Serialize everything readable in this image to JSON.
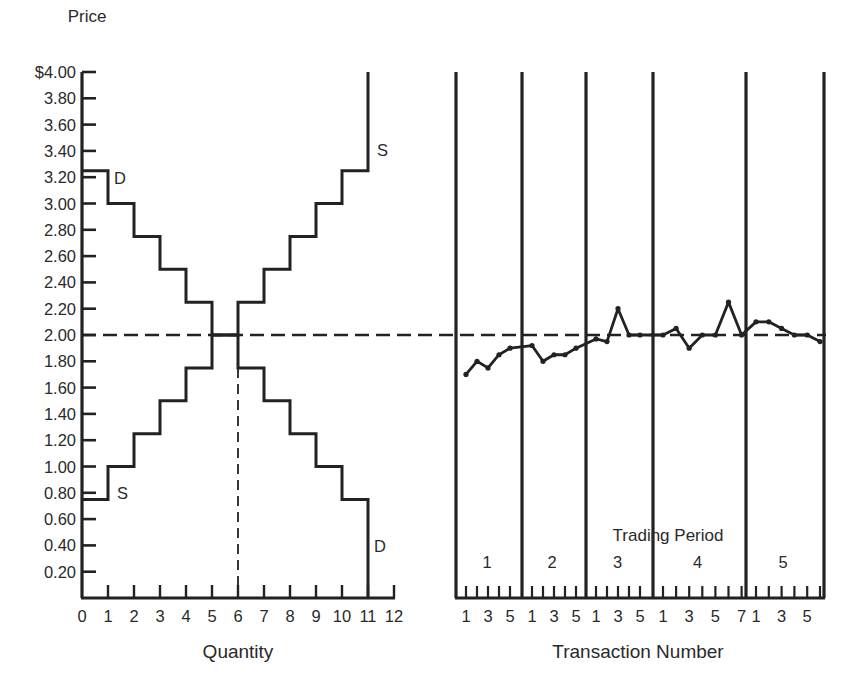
{
  "chart_data": [
    {
      "type": "line",
      "title": "",
      "ylabel": "Price",
      "xlabel": "Quantity",
      "ylim": [
        0,
        4.0
      ],
      "xlim": [
        0,
        12
      ],
      "y_ticks": [
        "$4.00",
        "3.80",
        "3.60",
        "3.40",
        "3.20",
        "3.00",
        "2.80",
        "2.60",
        "2.40",
        "2.20",
        "2.00",
        "1.80",
        "1.60",
        "1.40",
        "1.20",
        "1.00",
        "0.80",
        "0.60",
        "0.40",
        "0.20"
      ],
      "x_ticks": [
        "0",
        "1",
        "2",
        "3",
        "4",
        "5",
        "6",
        "7",
        "8",
        "9",
        "10",
        "11",
        "12"
      ],
      "equilibrium_price": 2.0,
      "equilibrium_quantity": 6,
      "series": [
        {
          "name": "D",
          "kind": "step",
          "description": "Demand step function",
          "steps": [
            {
              "q_from": 0,
              "q_to": 1,
              "price": 3.25
            },
            {
              "q_from": 1,
              "q_to": 2,
              "price": 3.0
            },
            {
              "q_from": 2,
              "q_to": 3,
              "price": 2.75
            },
            {
              "q_from": 3,
              "q_to": 4,
              "price": 2.5
            },
            {
              "q_from": 4,
              "q_to": 5,
              "price": 2.25
            },
            {
              "q_from": 5,
              "q_to": 6,
              "price": 2.0
            },
            {
              "q_from": 6,
              "q_to": 7,
              "price": 1.75
            },
            {
              "q_from": 7,
              "q_to": 8,
              "price": 1.5
            },
            {
              "q_from": 8,
              "q_to": 9,
              "price": 1.25
            },
            {
              "q_from": 9,
              "q_to": 10,
              "price": 1.0
            },
            {
              "q_from": 10,
              "q_to": 11,
              "price": 0.75
            },
            {
              "q_from": 11,
              "q_to": 11,
              "price": 0.0
            }
          ]
        },
        {
          "name": "S",
          "kind": "step",
          "description": "Supply step function",
          "steps": [
            {
              "q_from": 0,
              "q_to": 1,
              "price": 0.75
            },
            {
              "q_from": 1,
              "q_to": 2,
              "price": 1.0
            },
            {
              "q_from": 2,
              "q_to": 3,
              "price": 1.25
            },
            {
              "q_from": 3,
              "q_to": 4,
              "price": 1.5
            },
            {
              "q_from": 4,
              "q_to": 5,
              "price": 1.75
            },
            {
              "q_from": 5,
              "q_to": 6,
              "price": 2.0
            },
            {
              "q_from": 6,
              "q_to": 7,
              "price": 2.25
            },
            {
              "q_from": 7,
              "q_to": 8,
              "price": 2.5
            },
            {
              "q_from": 8,
              "q_to": 9,
              "price": 2.75
            },
            {
              "q_from": 9,
              "q_to": 10,
              "price": 3.0
            },
            {
              "q_from": 10,
              "q_to": 11,
              "price": 3.25
            },
            {
              "q_from": 11,
              "q_to": 11,
              "price": 4.0
            }
          ]
        }
      ],
      "labels": {
        "demand_top": "D",
        "demand_bottom": "D",
        "supply_top": "S",
        "supply_bottom": "S"
      }
    },
    {
      "type": "line",
      "title": "",
      "xlabel": "Transaction Number",
      "ylabel": "Price",
      "ylim": [
        0,
        4.0
      ],
      "grid": false,
      "reference_line": 2.0,
      "period_axis_label": "Trading Period",
      "periods": [
        {
          "label": "1",
          "transactions": [
            1,
            2,
            3,
            4,
            5
          ],
          "prices": [
            1.7,
            1.8,
            1.75,
            1.85,
            1.9
          ]
        },
        {
          "label": "2",
          "transactions": [
            1,
            2,
            3,
            4,
            5
          ],
          "prices": [
            1.92,
            1.8,
            1.85,
            1.85,
            1.9
          ]
        },
        {
          "label": "3",
          "transactions": [
            1,
            2,
            3,
            4,
            5
          ],
          "prices": [
            1.97,
            1.95,
            2.2,
            2.0,
            2.0
          ]
        },
        {
          "label": "4",
          "transactions": [
            1,
            2,
            3,
            4,
            5,
            6,
            7
          ],
          "prices": [
            2.0,
            2.05,
            1.9,
            2.0,
            2.0,
            2.25,
            2.0
          ]
        },
        {
          "label": "5",
          "transactions": [
            1,
            2,
            3,
            4,
            5,
            6
          ],
          "prices": [
            2.1,
            2.1,
            2.05,
            2.0,
            2.0,
            1.95
          ]
        }
      ],
      "x_tick_labels": [
        "1",
        "3",
        "51",
        "3",
        "51",
        "3",
        "51",
        "3",
        "5",
        "71",
        "3",
        "5"
      ]
    }
  ],
  "text": {
    "price_label": "Price",
    "quantity_label": "Quantity",
    "transaction_label": "Transaction Number",
    "trading_period_label": "Trading Period",
    "D": "D",
    "S": "S"
  }
}
